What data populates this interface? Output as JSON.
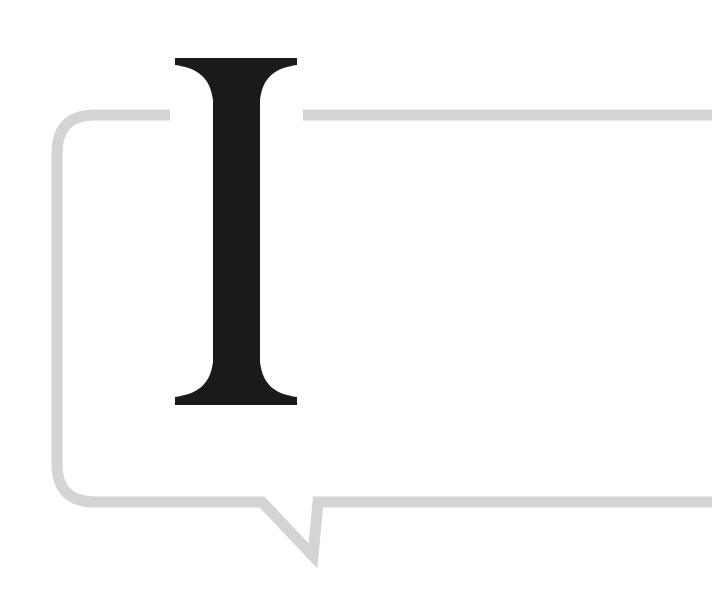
{
  "illustration": {
    "letter": "I",
    "description": "Large serif drop-cap letter overlapping a speech bubble outline",
    "colors": {
      "background": "#ffffff",
      "bubble_stroke": "#d4d4d4",
      "letter_fill": "#1a1a1a"
    },
    "bubble": {
      "stroke_width": 11,
      "corner_radius": 38,
      "tail": "bottom-left, pointing down-right"
    }
  }
}
